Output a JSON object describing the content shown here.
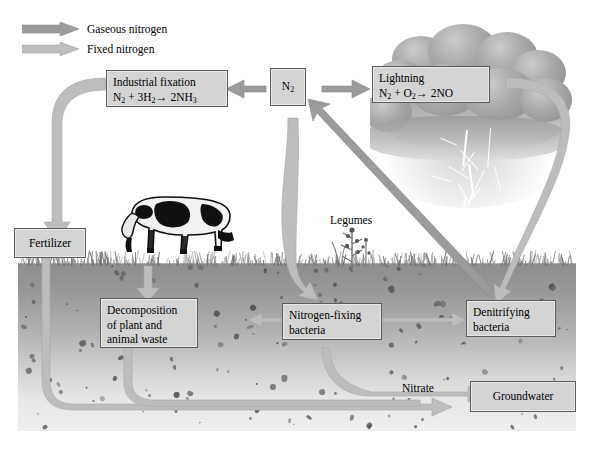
{
  "diagram": {
    "legend": [
      {
        "id": "gaseous",
        "label": "Gaseous nitrogen",
        "color": "#9b9b9b"
      },
      {
        "id": "fixed",
        "label": "Fixed nitrogen",
        "color": "#bdbdbd"
      }
    ],
    "boxes": {
      "industrial_fixation": {
        "line1": "Industrial fixation",
        "formula_pre": "N",
        "formula_sub1": "2",
        "formula_mid": " + 3H",
        "formula_sub2": "2",
        "formula_arrow": "→",
        "formula_post": " 2NH",
        "formula_sub3": "3"
      },
      "n2": {
        "label": "N",
        "sub": "2"
      },
      "lightning": {
        "line1": "Lightning",
        "formula_pre": "N",
        "formula_sub1": "2",
        "formula_mid": " + O",
        "formula_sub2": "2",
        "formula_arrow": "→",
        "formula_post": " 2NO"
      },
      "fertilizer": {
        "label": "Fertilizer"
      },
      "decomposition": {
        "line1": "Decomposition",
        "line2": "of plant and",
        "line3": "animal waste"
      },
      "nitrogen_fixing": {
        "line1": "Nitrogen-fixing",
        "line2": "bacteria"
      },
      "denitrifying": {
        "line1": "Denitrifying",
        "line2": "bacteria"
      },
      "groundwater": {
        "label": "Groundwater"
      }
    },
    "labels": {
      "legumes": "Legumes",
      "nitrate": "Nitrate"
    },
    "scene": {
      "cow": "grazing-holstein-cow",
      "cloud": "storm-cloud",
      "lightning": "lightning-bolts",
      "soil": "soil-cross-section",
      "grass": "grass-line"
    },
    "colors": {
      "box_fill": "#d4d4d4",
      "box_border": "#5d5d5d",
      "gaseous_arrow": "#9b9b9b",
      "fixed_arrow": "#bdbdbd",
      "soil_top": "#8d8d8d",
      "soil_bottom": "#efefef"
    }
  }
}
